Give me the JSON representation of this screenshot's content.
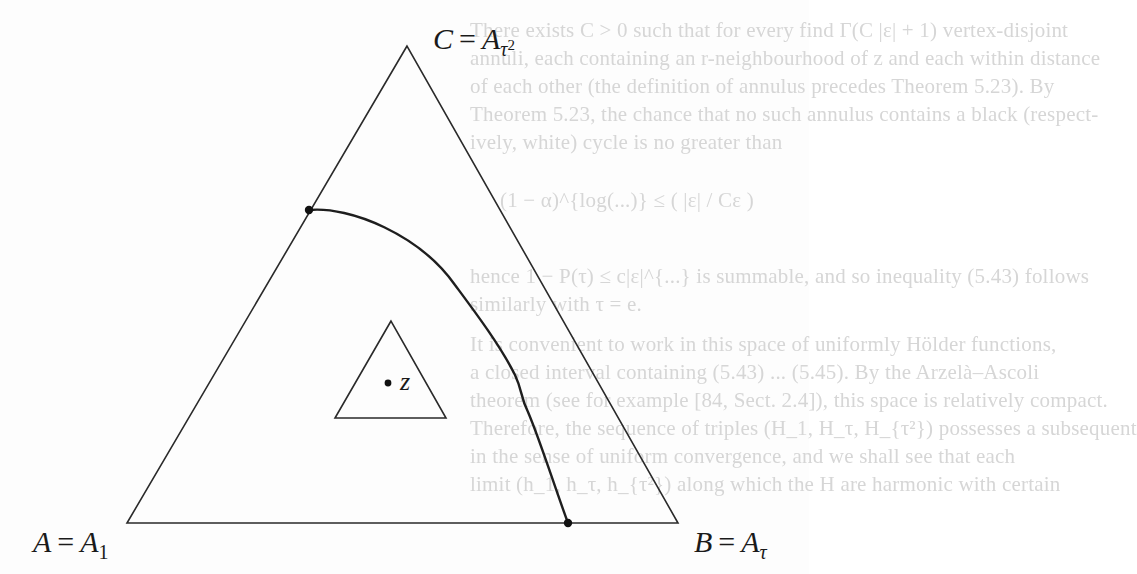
{
  "figure": {
    "vertices": {
      "A": {
        "name": "A",
        "equals": "A",
        "subscript": "1",
        "x": 127,
        "y": 523
      },
      "B": {
        "name": "B",
        "equals": "A",
        "subscript": "τ",
        "x": 678,
        "y": 523
      },
      "C": {
        "name": "C",
        "equals": "A",
        "subscript": "τ",
        "subscript_power": "2",
        "x": 407,
        "y": 46
      }
    },
    "labels": {
      "A_left": "A",
      "A_eq": "=",
      "A_right": "A",
      "A_sub": "1",
      "B_left": "B",
      "B_eq": "=",
      "B_right": "A",
      "B_sub": "τ",
      "C_left": "C",
      "C_eq": "=",
      "C_right": "A",
      "C_sub": "τ",
      "C_sub_power": "2"
    },
    "curve": {
      "start": {
        "x": 309,
        "y": 210
      },
      "end": {
        "x": 568,
        "y": 523
      },
      "description": "curve from point on side AC to point on base AB"
    },
    "inner_triangle": {
      "apex": {
        "x": 391,
        "y": 321
      },
      "bottom_left": {
        "x": 335,
        "y": 418
      },
      "bottom_right": {
        "x": 446,
        "y": 418
      }
    },
    "point_z": {
      "label": "z",
      "x": 388,
      "y": 383
    },
    "colors": {
      "stroke": "#2a2a2a",
      "curve": "#1e1e1e",
      "ghost_text": "#d6d6d6",
      "background": "#fdfdfd"
    }
  },
  "bleed_through_text": [
    "There exists C > 0 such that for every find Γ(C |ε| + 1) vertex-disjoint",
    "annuli, each containing an r-neighbourhood of z and each within distance",
    "of each other (the definition of annulus precedes Theorem 5.23). By",
    "Theorem 5.23, the chance that no such annulus contains a black (respect-",
    "ively, white) cycle is no greater than",
    "(1 − α)^{log(...)} ≤ ( |ε| / Cε )",
    "hence 1 − P(τ) ≤ c|ε|^{...} is summable, and so inequality (5.43) follows",
    "similarly with τ = e.",
    "It is convenient to work in this space of uniformly Hölder functions,",
    "a closed interval containing (5.43) ... (5.45). By the Arzelà–Ascoli",
    "theorem (see for example [84, Sect. 2.4]), this space is relatively compact.",
    "Therefore, the sequence of triples (H_1, H_τ, H_{τ²}) possesses a subsequent",
    "in the sense of uniform convergence, and we shall see that each",
    "limit (h_1, h_τ, h_{τ²}) along which the H are harmonic with certain"
  ]
}
